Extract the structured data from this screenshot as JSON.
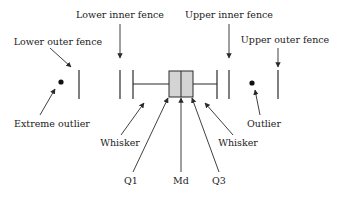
{
  "diagram": {
    "type": "boxplot-anatomy",
    "colors": {
      "stroke": "#2a2a2a",
      "box_fill": "#d4d4d4",
      "text": "#222222"
    },
    "labels": {
      "lower_inner_fence": "Lower inner fence",
      "lower_outer_fence": "Lower outer fence",
      "upper_inner_fence": "Upper inner fence",
      "upper_outer_fence": "Upper outer fence",
      "extreme_outlier": "Extreme outlier",
      "whisker_left": "Whisker",
      "whisker_right": "Whisker",
      "q1": "Q1",
      "median": "Md",
      "q3": "Q3",
      "outlier": "Outlier"
    }
  }
}
